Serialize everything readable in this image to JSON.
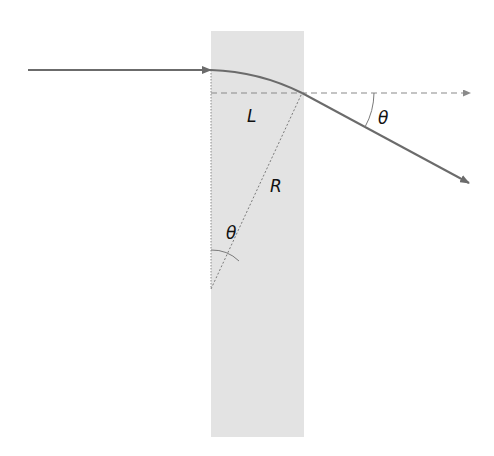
{
  "diagram": {
    "colors": {
      "slab": "#e3e3e3",
      "ray": "#6b6b6b",
      "guide": "#7a7a7a",
      "text": "#111111"
    },
    "labels": {
      "length": "L",
      "radius": "R",
      "angle_exit": "θ",
      "angle_center": "θ"
    },
    "elements": [
      {
        "id": "slab",
        "kind": "rectangle",
        "description": "gray slab region"
      },
      {
        "id": "incoming-ray",
        "kind": "arrow",
        "description": "horizontal incident ray"
      },
      {
        "id": "curved-path",
        "kind": "arc",
        "description": "circular trajectory inside slab"
      },
      {
        "id": "exit-ray",
        "kind": "arrow",
        "description": "deflected exit ray at angle θ"
      },
      {
        "id": "reference-line",
        "kind": "dashed-arrow",
        "description": "horizontal dashed reference line"
      },
      {
        "id": "radius-line",
        "kind": "dotted-line",
        "description": "radius R from center to exit point"
      },
      {
        "id": "vertical-line",
        "kind": "dotted-line",
        "description": "vertical radius at slab entry"
      }
    ]
  }
}
